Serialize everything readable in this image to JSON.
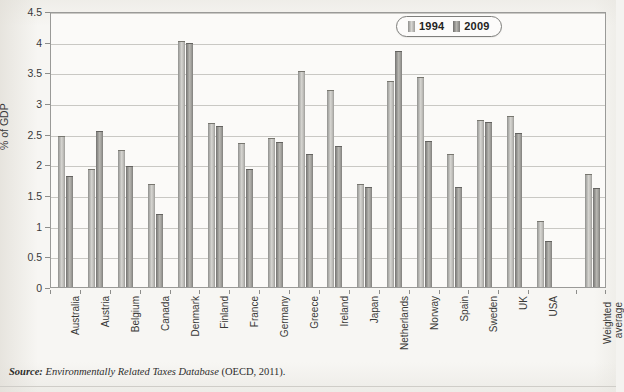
{
  "axis": {
    "y_title": "% of GDP",
    "y_ticks": [
      "0",
      "0.5",
      "1",
      "1.5",
      "2",
      "2.5",
      "3",
      "3.5",
      "4",
      "4.5"
    ]
  },
  "legend": {
    "items": [
      {
        "label": "1994",
        "color": "#c9c8c4"
      },
      {
        "label": "2009",
        "color": "#9b9a97"
      }
    ]
  },
  "source": {
    "prefix": "Source:",
    "title": "Environmentally Related Taxes Database",
    "suffix": "(OECD, 2011)."
  },
  "chart_data": {
    "type": "bar",
    "title": "",
    "xlabel": "",
    "ylabel": "% of GDP",
    "ylim": [
      0,
      4.5
    ],
    "ytick_step": 0.5,
    "grid": true,
    "legend_position": "top-right",
    "categories": [
      "Australia",
      "Austria",
      "Belgium",
      "Canada",
      "Denmark",
      "Finland",
      "France",
      "Germany",
      "Greece",
      "Ireland",
      "Japan",
      "Netherlands",
      "Norway",
      "Spain",
      "Sweden",
      "UK",
      "USA",
      "Weighted average"
    ],
    "series": [
      {
        "name": "1994",
        "values": [
          2.45,
          1.9,
          2.21,
          1.67,
          3.99,
          2.65,
          2.33,
          2.41,
          3.5,
          3.19,
          1.67,
          3.35,
          3.4,
          2.16,
          2.7,
          2.77,
          1.06,
          1.82
        ]
      },
      {
        "name": "2009",
        "values": [
          1.79,
          2.52,
          1.96,
          1.18,
          3.97,
          2.61,
          1.9,
          2.35,
          2.15,
          2.28,
          1.62,
          3.83,
          2.37,
          1.62,
          2.68,
          2.5,
          0.73,
          1.6
        ]
      }
    ]
  }
}
